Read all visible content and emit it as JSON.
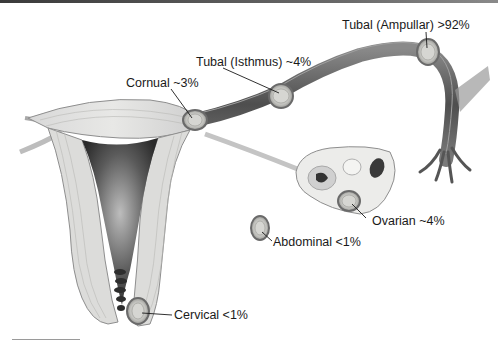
{
  "diagram": {
    "labels": [
      {
        "id": "tubal-ampullar",
        "text": "Tubal (Ampullar) >92%",
        "x": 342,
        "y": 18
      },
      {
        "id": "tubal-isthmus",
        "text": "Tubal (Isthmus) ~4%",
        "x": 196,
        "y": 55
      },
      {
        "id": "cornual",
        "text": "Cornual ~3%",
        "x": 126,
        "y": 76
      },
      {
        "id": "ovarian",
        "text": "Ovarian ~4%",
        "x": 372,
        "y": 214
      },
      {
        "id": "abdominal",
        "text": "Abdominal <1%",
        "x": 273,
        "y": 235
      },
      {
        "id": "cervical",
        "text": "Cervical <1%",
        "x": 174,
        "y": 308
      }
    ]
  }
}
